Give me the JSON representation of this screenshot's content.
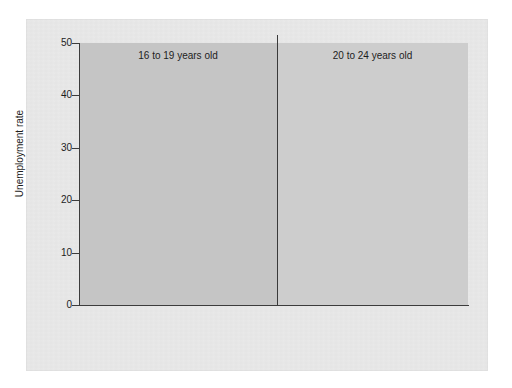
{
  "chart_data": {
    "type": "bar",
    "title": "",
    "subtitle": "",
    "xlabel": "",
    "ylabel": "Unemployment rate",
    "ylim": [
      0,
      50
    ],
    "yticks": [
      0,
      10,
      20,
      30,
      40,
      50
    ],
    "ytick_labels": [
      "0",
      "10",
      "20",
      "30",
      "40",
      "50"
    ],
    "grid": false,
    "legend_position": "bottom",
    "panels": [
      {
        "title": "16 to 19 years old",
        "categories": [
          "Men",
          "Women"
        ],
        "series": [
          {
            "name": "European American",
            "values": [
              18.4,
              15.8
            ]
          },
          {
            "name": "Hispanic",
            "values": [
              28.1,
              26.5
            ]
          },
          {
            "name": "African American",
            "values": [
              41.4,
              37.8
            ]
          }
        ]
      },
      {
        "title": "20 to 24 years old",
        "categories": [
          "Men",
          "Women"
        ],
        "series": [
          {
            "name": "European American",
            "values": [
              10.4,
              8.9
            ]
          },
          {
            "name": "Hispanic",
            "values": [
              13.5,
              12.4
            ]
          },
          {
            "name": "African American",
            "values": [
              23.8,
              22.6
            ]
          }
        ]
      }
    ],
    "legend": [
      {
        "label": "European American",
        "color": "#6e6e6e"
      },
      {
        "label": "Hispanic",
        "color": "#8a8a8a"
      },
      {
        "label": "African American",
        "color": "#a8a8a8"
      }
    ],
    "colors": {
      "european_american": "#6e6e6e",
      "hispanic": "#8a8a8a",
      "african_american": "#a8a8a8",
      "panel_left_bg": "#c5c5c5",
      "panel_right_bg": "#cdcdcd",
      "figure_bg": "#e9e9e9",
      "axis": "#3c3c3c",
      "text": "#1d1d1d"
    }
  }
}
